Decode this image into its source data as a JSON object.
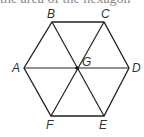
{
  "header": {
    "cut_text": "the area of the hexagon"
  },
  "diagram": {
    "stroke_color": "#222222",
    "label_color": "#333333",
    "vertices": {
      "A": {
        "label": "A",
        "x": 24,
        "y": 68
      },
      "B": {
        "label": "B",
        "x": 52,
        "y": 22
      },
      "C": {
        "label": "C",
        "x": 104,
        "y": 22
      },
      "D": {
        "label": "D",
        "x": 129,
        "y": 68
      },
      "E": {
        "label": "E",
        "x": 104,
        "y": 116
      },
      "F": {
        "label": "F",
        "x": 51,
        "y": 116
      },
      "G": {
        "label": "G",
        "x": 77,
        "y": 68
      }
    },
    "edges": [
      "AB",
      "BC",
      "CD",
      "DE",
      "EF",
      "FA",
      "AD",
      "BE",
      "CF"
    ]
  }
}
